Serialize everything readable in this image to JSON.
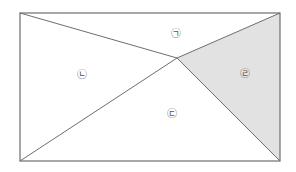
{
  "diagram": {
    "type": "rectangle-partition",
    "rectangle": {
      "x1": 20,
      "y1": 13,
      "x2": 280,
      "y2": 161
    },
    "interior_point": {
      "x": 177,
      "y": 58
    },
    "colors": {
      "line": "#6e6e6e",
      "shade": "#e2e2e2",
      "background": "#ffffff",
      "label": "#555555"
    },
    "regions": [
      {
        "id": "giyeok",
        "label": "㉠",
        "shaded": false,
        "label_x": 176,
        "label_y": 33
      },
      {
        "id": "nieun",
        "label": "㉡",
        "shaded": false,
        "label_x": 82,
        "label_y": 74
      },
      {
        "id": "digeut",
        "label": "㉢",
        "shaded": false,
        "label_x": 172,
        "label_y": 113
      },
      {
        "id": "rieul",
        "label": "㉣",
        "shaded": true,
        "label_x": 245,
        "label_y": 73
      }
    ]
  }
}
